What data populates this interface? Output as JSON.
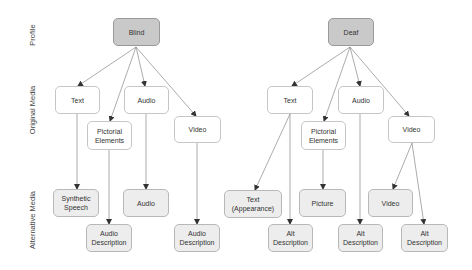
{
  "row_labels": [
    {
      "id": "profile",
      "text": "Profile",
      "x": 32,
      "y": 35
    },
    {
      "id": "original",
      "text": "Original Media",
      "x": 32,
      "y": 110
    },
    {
      "id": "alternative",
      "text": "Alternative Media",
      "x": 32,
      "y": 220
    }
  ],
  "colors": {
    "profile_fill": "#c9c9c9",
    "original_fill": "#ffffff",
    "alt_fill": "#ededed",
    "edge": "#888888",
    "text": "#333333"
  },
  "nodes": [
    {
      "id": "blind",
      "label": "Blind",
      "type": "profile",
      "x": 113,
      "y": 18,
      "w": 47,
      "h": 28
    },
    {
      "id": "b_text",
      "label": "Text",
      "type": "original",
      "x": 55,
      "y": 86,
      "w": 45,
      "h": 28
    },
    {
      "id": "b_pict",
      "label": "Pictorial\nElements",
      "type": "original",
      "x": 87,
      "y": 121,
      "w": 45,
      "h": 29
    },
    {
      "id": "b_audio",
      "label": "Audio",
      "type": "original",
      "x": 124,
      "y": 86,
      "w": 45,
      "h": 28
    },
    {
      "id": "b_video",
      "label": "Video",
      "type": "original",
      "x": 174,
      "y": 116,
      "w": 47,
      "h": 27
    },
    {
      "id": "b_synth",
      "label": "Synthetic\nSpeech",
      "type": "alt",
      "x": 53,
      "y": 189,
      "w": 46,
      "h": 28
    },
    {
      "id": "b_audio_alt",
      "label": "Audio",
      "type": "alt",
      "x": 123,
      "y": 189,
      "w": 46,
      "h": 28
    },
    {
      "id": "b_pict_ad",
      "label": "Audio\nDescription",
      "type": "alt",
      "x": 86,
      "y": 224,
      "w": 46,
      "h": 28
    },
    {
      "id": "b_video_ad",
      "label": "Audio\nDescription",
      "type": "alt",
      "x": 174,
      "y": 224,
      "w": 46,
      "h": 28
    },
    {
      "id": "deaf",
      "label": "Deaf",
      "type": "profile",
      "x": 328,
      "y": 18,
      "w": 46,
      "h": 28
    },
    {
      "id": "d_text",
      "label": "Text",
      "type": "original",
      "x": 267,
      "y": 86,
      "w": 46,
      "h": 28
    },
    {
      "id": "d_pict",
      "label": "Pictorial\nElements",
      "type": "original",
      "x": 301,
      "y": 121,
      "w": 45,
      "h": 29
    },
    {
      "id": "d_audio",
      "label": "Audio",
      "type": "original",
      "x": 338,
      "y": 86,
      "w": 46,
      "h": 28
    },
    {
      "id": "d_video",
      "label": "Video",
      "type": "original",
      "x": 388,
      "y": 116,
      "w": 47,
      "h": 27
    },
    {
      "id": "d_text_app",
      "label": "Text\n(Appearance)",
      "type": "alt",
      "x": 224,
      "y": 190,
      "w": 58,
      "h": 28
    },
    {
      "id": "d_text_ad",
      "label": "Alt\nDescription",
      "type": "alt",
      "x": 268,
      "y": 224,
      "w": 45,
      "h": 28
    },
    {
      "id": "d_picture",
      "label": "Picture",
      "type": "alt",
      "x": 299,
      "y": 189,
      "w": 47,
      "h": 28
    },
    {
      "id": "d_audio_ad",
      "label": "Alt\nDescription",
      "type": "alt",
      "x": 338,
      "y": 224,
      "w": 45,
      "h": 28
    },
    {
      "id": "d_video_alt",
      "label": "Video",
      "type": "alt",
      "x": 368,
      "y": 189,
      "w": 45,
      "h": 28
    },
    {
      "id": "d_video_ad",
      "label": "Alt\nDescription",
      "type": "alt",
      "x": 401,
      "y": 224,
      "w": 47,
      "h": 28
    }
  ],
  "edges": [
    {
      "from": "blind",
      "to": "b_text",
      "x1": 136,
      "y1": 47,
      "x2": 78,
      "y2": 86
    },
    {
      "from": "blind",
      "to": "b_pict",
      "x1": 136,
      "y1": 47,
      "x2": 110,
      "y2": 121
    },
    {
      "from": "blind",
      "to": "b_audio",
      "x1": 136,
      "y1": 47,
      "x2": 145,
      "y2": 86
    },
    {
      "from": "blind",
      "to": "b_video",
      "x1": 136,
      "y1": 47,
      "x2": 196,
      "y2": 116
    },
    {
      "from": "b_text",
      "to": "b_synth",
      "x1": 77,
      "y1": 114,
      "x2": 77,
      "y2": 189
    },
    {
      "from": "b_pict",
      "to": "b_pict_ad",
      "x1": 109,
      "y1": 150,
      "x2": 109,
      "y2": 224
    },
    {
      "from": "b_audio",
      "to": "b_audio_alt",
      "x1": 146,
      "y1": 114,
      "x2": 146,
      "y2": 189
    },
    {
      "from": "b_video",
      "to": "b_video_ad",
      "x1": 197,
      "y1": 143,
      "x2": 197,
      "y2": 224
    },
    {
      "from": "deaf",
      "to": "d_text",
      "x1": 350,
      "y1": 47,
      "x2": 292,
      "y2": 86
    },
    {
      "from": "deaf",
      "to": "d_pict",
      "x1": 350,
      "y1": 47,
      "x2": 324,
      "y2": 121
    },
    {
      "from": "deaf",
      "to": "d_audio",
      "x1": 350,
      "y1": 47,
      "x2": 360,
      "y2": 86
    },
    {
      "from": "deaf",
      "to": "d_video",
      "x1": 350,
      "y1": 47,
      "x2": 409,
      "y2": 116
    },
    {
      "from": "d_text",
      "to": "d_text_app",
      "x1": 290,
      "y1": 114,
      "x2": 255,
      "y2": 190
    },
    {
      "from": "d_text",
      "to": "d_text_ad",
      "x1": 290,
      "y1": 114,
      "x2": 290,
      "y2": 224
    },
    {
      "from": "d_pict",
      "to": "d_picture",
      "x1": 323,
      "y1": 150,
      "x2": 323,
      "y2": 189
    },
    {
      "from": "d_audio",
      "to": "d_audio_ad",
      "x1": 360,
      "y1": 114,
      "x2": 360,
      "y2": 224
    },
    {
      "from": "d_video",
      "to": "d_video_alt",
      "x1": 412,
      "y1": 143,
      "x2": 393,
      "y2": 189
    },
    {
      "from": "d_video",
      "to": "d_video_ad",
      "x1": 412,
      "y1": 143,
      "x2": 424,
      "y2": 224
    }
  ]
}
